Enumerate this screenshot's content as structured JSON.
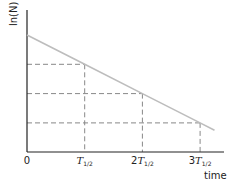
{
  "chart_data": {
    "type": "line",
    "title": "",
    "xlabel": "time",
    "ylabel": "ln(N)",
    "x_ticks": [
      {
        "label": "0",
        "prefix": "",
        "symbol": "",
        "sub": "",
        "x": 0
      },
      {
        "label": "T1/2",
        "prefix": "",
        "symbol": "T",
        "sub": "1/2",
        "x": 1
      },
      {
        "label": "2T1/2",
        "prefix": "2",
        "symbol": "T",
        "sub": "1/2",
        "x": 2
      },
      {
        "label": "3T1/2",
        "prefix": "3",
        "symbol": "T",
        "sub": "1/2",
        "x": 3
      }
    ],
    "series": [
      {
        "name": "ln(N) vs time",
        "color": "#bdbdbd",
        "x": [
          0,
          1,
          2,
          3,
          3.25
        ],
        "y": [
          4,
          3,
          2,
          1,
          0.75
        ]
      }
    ],
    "reference_lines": {
      "style": "dashed",
      "color": "#888888",
      "points": [
        {
          "x": 1,
          "y": 3
        },
        {
          "x": 2,
          "y": 2
        },
        {
          "x": 3,
          "y": 1
        }
      ]
    },
    "xlim": [
      0,
      3.4
    ],
    "ylim": [
      0,
      5
    ],
    "grid": false,
    "legend": "none"
  }
}
